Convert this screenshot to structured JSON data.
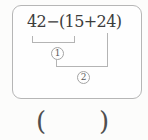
{
  "colors": {
    "background": "#fcfcfb",
    "box_border": "#b6b6b6",
    "expression_text": "#3c3c3c",
    "bracket_line": "#b4b4b4",
    "badge_border": "#a4a4a4",
    "badge_text": "#5a5a5a",
    "answer_paren": "#4f4f4f"
  },
  "expression_box": {
    "expression": "42−(15+24)",
    "steps": [
      {
        "label": "1"
      },
      {
        "label": "2"
      }
    ]
  },
  "answer": {
    "open_paren": "(",
    "close_paren": ")"
  }
}
